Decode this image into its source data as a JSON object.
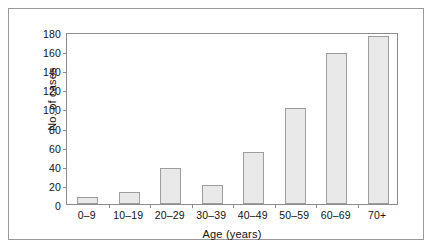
{
  "figure": {
    "frame_color": "#9a9a9a",
    "axis_color": "#8c8c8c",
    "bar_fill": "#e9e9e9",
    "bar_border": "#9d9d9d",
    "background": "#ffffff"
  },
  "chart_data": {
    "type": "bar",
    "title": "",
    "subtitle": "",
    "xlabel": "Age (years)",
    "ylabel": "No. of cases",
    "categories": [
      "0–9",
      "10–19",
      "20–29",
      "30–39",
      "40–49",
      "50–59",
      "60–69",
      "70+"
    ],
    "values": [
      7,
      13,
      38,
      20,
      54,
      101,
      158,
      176
    ],
    "ylim": [
      0,
      180
    ],
    "yticks": [
      0,
      20,
      40,
      60,
      80,
      100,
      120,
      140,
      160,
      180
    ],
    "ytick_labels": [
      "0",
      "20",
      "40",
      "60",
      "80",
      "100",
      "120",
      "140",
      "160",
      "180"
    ],
    "grid": false,
    "legend": null,
    "legend_position": "none",
    "annotations": []
  }
}
